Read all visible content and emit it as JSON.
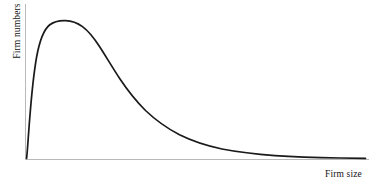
{
  "figure": {
    "background_color": "#ffffff",
    "width": 369,
    "height": 182
  },
  "axes": {
    "x_label": "Firm size",
    "y_label": "Firm numbers",
    "axis_color": "#b9b9b9",
    "x_axis": {
      "x_start": 25,
      "x_end": 369,
      "y": 159
    },
    "y_axis": {
      "x": 25,
      "y_start": 4,
      "y_end": 159
    }
  },
  "chart_data": {
    "type": "line",
    "title": "",
    "subtitle": "",
    "xlabel": "Firm size",
    "ylabel": "Firm numbers",
    "grid": false,
    "legend": null,
    "legend_position": "none",
    "axis_ticks": {
      "x": [],
      "y": []
    },
    "xlim": [
      0,
      100
    ],
    "ylim": [
      0,
      100
    ],
    "annotations": [],
    "series": [
      {
        "name": "Firm size distribution",
        "color": "#1a1a1a",
        "line_width": 1.7,
        "shape": "right-skewed lognormal",
        "peak_x": 13,
        "peak_y": 94,
        "x": [
          0,
          0.6,
          1.2,
          2,
          3,
          4.5,
          6,
          7.5,
          9,
          10.5,
          12,
          13,
          14.5,
          16.5,
          19,
          22,
          25,
          28,
          32,
          36,
          40,
          45,
          50,
          55,
          60,
          65,
          70,
          75,
          80,
          85,
          90,
          95,
          100
        ],
        "y": [
          0,
          6,
          20,
          42,
          62,
          78,
          87,
          91,
          93.5,
          94.5,
          94.8,
          94.5,
          93,
          89,
          83,
          74,
          65,
          57,
          47,
          39,
          32,
          25,
          19.5,
          15.5,
          12.5,
          10,
          8,
          6.5,
          5.4,
          4.6,
          4.1,
          3.8,
          3.6
        ]
      }
    ]
  },
  "curve_path": "M 26.6 158.4 C 27.5 150.5 28.3 136.0 29.6 120.0 C 31.3 98.0 33.6 74.0 36.6 57.0 C 40.0 38.5 44.6 29.0 49.5 25.0 C 54.5 21.0 60.0 20.4 65.5 20.6 C 71.5 20.8 77.0 22.6 82.5 26.6 C 88.5 31.0 94.0 38.0 99.5 46.5 C 106.0 56.5 113.0 68.5 120.0 79.0 C 128.0 91.0 136.5 101.5 145.5 110.5 C 156.0 120.5 167.5 128.5 179.5 134.8 C 193.0 141.5 207.5 146.0 222.0 149.0 C 239.0 152.3 257.0 154.3 275.0 155.6 C 296.0 157.0 318.0 157.6 340.0 158.0 C 350.0 158.1 358.0 158.2 365.5 158.3"
}
